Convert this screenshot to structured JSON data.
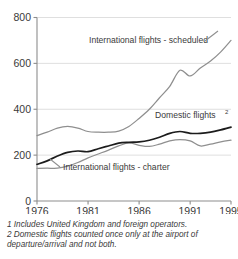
{
  "chart_data": {
    "type": "line",
    "title": "",
    "subtitle": "",
    "xlabel": "",
    "ylabel": "",
    "xlim": [
      1976,
      1995
    ],
    "ylim": [
      0,
      800
    ],
    "grid": true,
    "legend_position": "inline-annotations",
    "x": [
      1976,
      1977,
      1978,
      1979,
      1980,
      1981,
      1982,
      1983,
      1984,
      1985,
      1986,
      1987,
      1988,
      1989,
      1990,
      1991,
      1992,
      1993,
      1994,
      1995
    ],
    "xticks": [
      "1976",
      "1981",
      "1986",
      "1991",
      "1995"
    ],
    "xtick_values": [
      1976,
      1981,
      1986,
      1991,
      1995
    ],
    "yticks": [
      "0",
      "200",
      "400",
      "600",
      "800"
    ],
    "ytick_values": [
      0,
      200,
      400,
      600,
      800
    ],
    "series": [
      {
        "name": "International flights - scheduled",
        "label": "International flights - scheduled",
        "color": "#8f8f8f",
        "values": [
          285,
          300,
          318,
          325,
          318,
          303,
          300,
          300,
          305,
          325,
          360,
          400,
          450,
          500,
          570,
          545,
          580,
          610,
          650,
          700
        ]
      },
      {
        "name": "Domestic flights",
        "label": "Domestic flights",
        "label_superscript": "2",
        "color": "#1c1c1c",
        "values": [
          160,
          175,
          196,
          212,
          218,
          215,
          228,
          240,
          252,
          256,
          258,
          265,
          278,
          295,
          303,
          295,
          295,
          300,
          310,
          322
        ]
      },
      {
        "name": "International flights - charter",
        "label": "International flights - charter",
        "color": "#8f8f8f",
        "values": [
          142,
          143,
          143,
          152,
          168,
          188,
          205,
          222,
          240,
          253,
          243,
          238,
          248,
          262,
          268,
          262,
          240,
          248,
          258,
          265
        ]
      }
    ]
  },
  "footnotes": {
    "note1": "1 Includes United Kingdom and foreign operators.",
    "note2": "2 Domestic flights counted once only at the airport of departure/arrival and not both."
  }
}
